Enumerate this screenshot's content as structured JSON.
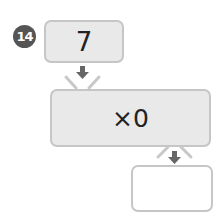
{
  "problem": {
    "number": "14",
    "start_value": "7",
    "operation": "×0",
    "answer": ""
  },
  "colors": {
    "badge": "#555555",
    "box_fill": "#e9e9e9",
    "box_border": "#c6c6c6",
    "arrow": "#666666",
    "chevron": "#c8c8c8"
  }
}
